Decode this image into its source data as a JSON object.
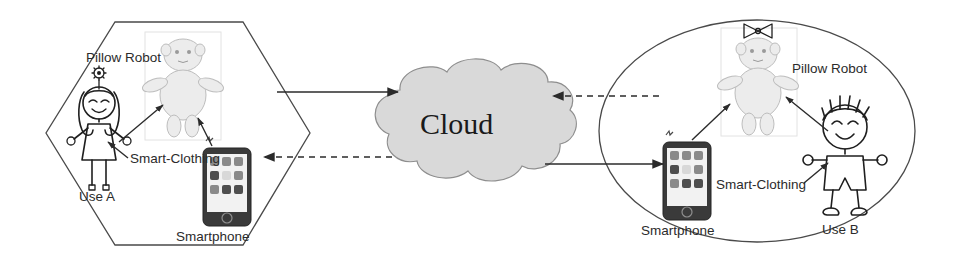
{
  "diagram": {
    "cloud": {
      "label": "Cloud",
      "fill_color": "#d9d9d9",
      "stroke_color": "#8e8e8e"
    },
    "left_group": {
      "shape": "hexagon",
      "user_label": "Use A",
      "robot_label": "Pillow Robot",
      "clothing_label": "Smart-Clothing",
      "phone_label": "Smartphone",
      "user_gender_marker": "girl-with-flower",
      "robot_marker": "plain-head"
    },
    "right_group": {
      "shape": "ellipse",
      "user_label": "Use B",
      "robot_label": "Pillow Robot",
      "clothing_label": "Smart-Clothing",
      "phone_label": "Smartphone",
      "user_gender_marker": "boy-with-spiky-hair",
      "robot_marker": "bow-on-head"
    },
    "connections": [
      {
        "name": "left-to-cloud",
        "style": "solid",
        "direction": "right"
      },
      {
        "name": "cloud-to-left",
        "style": "dashed",
        "direction": "left"
      },
      {
        "name": "right-to-cloud",
        "style": "dashed",
        "direction": "left"
      },
      {
        "name": "cloud-to-right",
        "style": "solid",
        "direction": "right"
      }
    ],
    "colors": {
      "ink": "#1f1f1f",
      "boundary": "#4a4a4a",
      "robot_fill": "#ececec",
      "phone_body": "#3a3a3a"
    }
  }
}
